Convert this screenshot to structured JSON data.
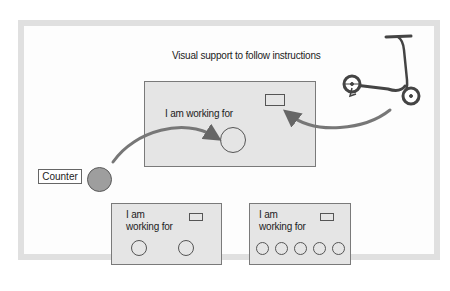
{
  "title": "Visual support to follow instructions",
  "main_panel": {
    "label": "I am working for",
    "token_slots": 1
  },
  "counter": {
    "label": "Counter",
    "token_color": "#9e9e9e"
  },
  "reward_image": "scooter-icon",
  "example_panels": [
    {
      "label_line1": "I am",
      "label_line2": "working for",
      "token_slots": 2
    },
    {
      "label_line1": "I am",
      "label_line2": "working for",
      "token_slots": 5
    }
  ],
  "arrows": [
    {
      "from": "counter-token",
      "to": "main-token-slot"
    },
    {
      "from": "scooter",
      "to": "reward-slot"
    }
  ],
  "colors": {
    "frame": "#e0e0e0",
    "panel_fill": "#e5e5e5",
    "arrow": "#707070"
  }
}
